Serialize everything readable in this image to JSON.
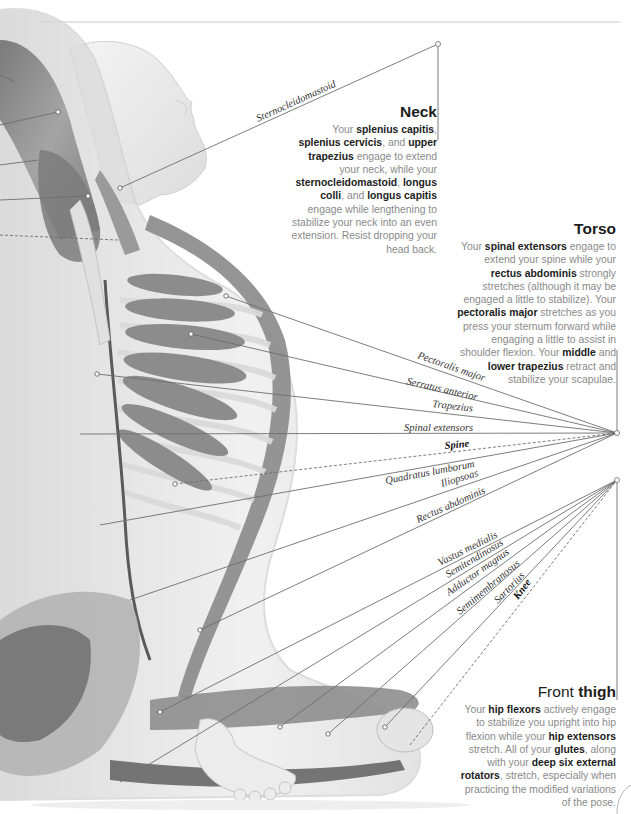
{
  "colors": {
    "body_text": "#8a8a8a",
    "bold_text": "#1c1c1c",
    "leader_line": "#6e6e6e",
    "muscle": "#7d7d7d",
    "skin": "#e6e6e6"
  },
  "neck": {
    "title": "Neck",
    "segments": [
      {
        "t": "Your ",
        "b": false
      },
      {
        "t": "splenius capitis",
        "b": true
      },
      {
        "t": ", ",
        "b": false
      },
      {
        "t": "splenius cervicis",
        "b": true
      },
      {
        "t": ", and ",
        "b": false
      },
      {
        "t": "upper trapezius",
        "b": true
      },
      {
        "t": " engage to extend your neck, while your ",
        "b": false
      },
      {
        "t": "sternocleidomastoid",
        "b": true
      },
      {
        "t": ", ",
        "b": false
      },
      {
        "t": "longus colli",
        "b": true
      },
      {
        "t": ", and ",
        "b": false
      },
      {
        "t": "longus capitis",
        "b": true
      },
      {
        "t": " engage while lengthening to stabilize your neck into an even extension. Resist dropping your head back.",
        "b": false
      }
    ],
    "labels": [
      {
        "text": "Sternocleidomastoid",
        "bold": false
      }
    ]
  },
  "torso": {
    "title": "Torso",
    "segments": [
      {
        "t": "Your ",
        "b": false
      },
      {
        "t": "spinal extensors",
        "b": true
      },
      {
        "t": " engage to extend your spine while your ",
        "b": false
      },
      {
        "t": "rectus abdominis",
        "b": true
      },
      {
        "t": " strongly stretches (although it may be engaged a little to stabilize). Your ",
        "b": false
      },
      {
        "t": "pectoralis major",
        "b": true
      },
      {
        "t": " stretches as you press your sternum forward while engaging a little to assist in shoulder flexion. Your ",
        "b": false
      },
      {
        "t": "middle",
        "b": true
      },
      {
        "t": " and ",
        "b": false
      },
      {
        "t": "lower trapezius",
        "b": true
      },
      {
        "t": " retract and stabilize your scapulae.",
        "b": false
      }
    ],
    "labels": [
      {
        "text": "Pectoralis major",
        "bold": false
      },
      {
        "text": "Serratus anterior",
        "bold": false
      },
      {
        "text": "Trapezius",
        "bold": false
      },
      {
        "text": "Spinal extensors",
        "bold": false
      },
      {
        "text": "Spine",
        "bold": true
      },
      {
        "text": "Quadratus lumborum",
        "bold": false
      },
      {
        "text": "Iliopsoas",
        "bold": false
      },
      {
        "text": "Rectus abdominis",
        "bold": false
      }
    ]
  },
  "thigh": {
    "title_light": "Front ",
    "title_bold": "thigh",
    "segments": [
      {
        "t": "Your ",
        "b": false
      },
      {
        "t": "hip flexors",
        "b": true
      },
      {
        "t": " actively engage to stabilize you upright into hip flexion while your ",
        "b": false
      },
      {
        "t": "hip extensors",
        "b": true
      },
      {
        "t": " stretch. All of your ",
        "b": false
      },
      {
        "t": "glutes",
        "b": true
      },
      {
        "t": ", along with your ",
        "b": false
      },
      {
        "t": "deep six external rotators",
        "b": true
      },
      {
        "t": ", stretch, especially when practicing the modified variations of the pose.",
        "b": false
      }
    ],
    "labels": [
      {
        "text": "Vastus medialis",
        "bold": false
      },
      {
        "text": "Semitendinosus",
        "bold": false
      },
      {
        "text": "Adductor magnus",
        "bold": false
      },
      {
        "text": "Semimembranosus",
        "bold": false
      },
      {
        "text": "Sartorius",
        "bold": false
      },
      {
        "text": "Knee",
        "bold": true
      }
    ]
  }
}
